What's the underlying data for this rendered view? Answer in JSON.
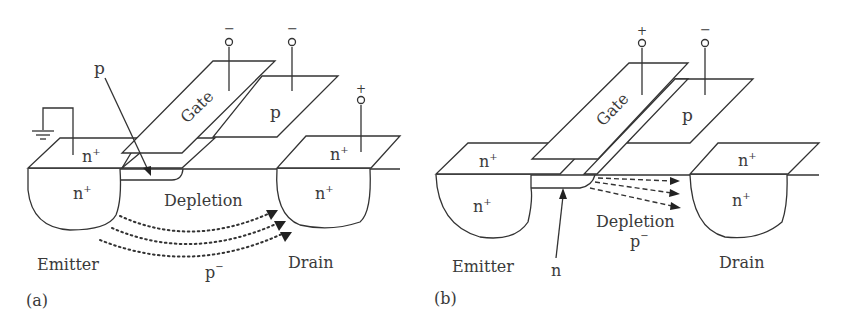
{
  "panels": [
    {
      "id": "a",
      "caption": "(a)",
      "labels": {
        "gate": "Gate",
        "p_body": "p",
        "p_channel": "p",
        "emitter_top": "n+",
        "emitter_well": "n+",
        "drain_top": "n+",
        "drain_well": "n+",
        "depletion": "Depletion",
        "substrate": "p−",
        "emitter": "Emitter",
        "drain": "Drain"
      },
      "terminals": {
        "gate": "−",
        "p_contact": "−",
        "drain": "+",
        "emitter": "ground"
      },
      "flow_style": "dotted-curved"
    },
    {
      "id": "b",
      "caption": "(b)",
      "labels": {
        "gate": "Gate",
        "p_body": "p",
        "channel": "n",
        "emitter_top": "n+",
        "emitter_well": "n+",
        "drain_top": "n+",
        "drain_well": "n+",
        "depletion": "Depletion",
        "substrate": "p−",
        "emitter": "Emitter",
        "drain": "Drain"
      },
      "terminals": {
        "gate": "+",
        "p_contact": "−"
      },
      "flow_style": "dashed-straight"
    }
  ],
  "text": {
    "a_gate": "Gate",
    "a_p_body": "p",
    "a_p_arrow": "p",
    "a_em_top_n": "n",
    "a_em_well_n": "n",
    "a_dr_top_n": "n",
    "a_dr_well_n": "n",
    "sup_plus": "+",
    "sup_minus": "−",
    "a_depletion": "Depletion",
    "a_sub_p": "p",
    "a_emitter": "Emitter",
    "a_drain": "Drain",
    "a_caption": "(a)",
    "a_term_gate": "−",
    "a_term_p": "−",
    "a_term_drain": "+",
    "b_gate": "Gate",
    "b_p_body": "p",
    "b_n_arrow": "n",
    "b_em_top_n": "n",
    "b_em_well_n": "n",
    "b_dr_top_n": "n",
    "b_dr_well_n": "n",
    "b_depletion": "Depletion",
    "b_sub_p": "p",
    "b_emitter": "Emitter",
    "b_drain": "Drain",
    "b_caption": "(b)",
    "b_term_gate": "+",
    "b_term_p": "−"
  }
}
